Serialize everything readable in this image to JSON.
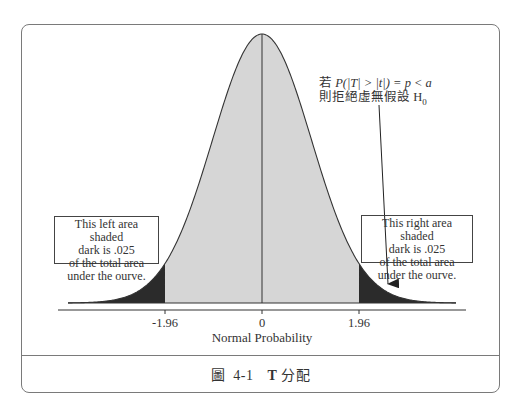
{
  "chart_data": {
    "type": "area",
    "title": "圖 4-1 T 分配",
    "xlabel": "Normal Probability",
    "ylabel": "",
    "x_ticks": [
      -1.96,
      0,
      1.96
    ],
    "x_tick_labels": [
      "-1.96",
      "0",
      "1.96"
    ],
    "distribution": "standard normal density curve",
    "shaded_regions": [
      {
        "name": "left tail",
        "from": "-inf",
        "to": -1.96,
        "area": 0.025,
        "shade": "dark"
      },
      {
        "name": "center",
        "from": -1.96,
        "to": 1.96,
        "area": 0.95,
        "shade": "light"
      },
      {
        "name": "right tail",
        "from": 1.96,
        "to": "inf",
        "area": 0.025,
        "shade": "dark"
      }
    ],
    "annotations": [
      "This left area shaded dark is .025 of the total area under the ourve.",
      "This right area shaded dark is .025 of the total area under the ourve.",
      "若 P(|T| > |t|) = p < a 則拒絕虛無假設 H0"
    ],
    "grid": false,
    "legend": null
  },
  "figure": {
    "caption_prefix": "圖",
    "caption_number": "4-1",
    "caption_bold": "T",
    "caption_text": "分配"
  },
  "annotation_top": {
    "line1_prefix": "若 ",
    "line1_formula": "P(|T| > |t|) = p < a",
    "line2_text": "則拒絕虛無假設 H",
    "line2_sub": "0"
  },
  "left_box": {
    "lines": [
      "This left area shaded",
      "dark is .025",
      "of the total area",
      "under the ourve."
    ]
  },
  "right_box": {
    "lines": [
      "This right area shaded",
      "dark is .025",
      "of the total area",
      "under the ourve."
    ]
  },
  "axis": {
    "ticks": [
      "-1.96",
      "0",
      "1.96"
    ],
    "label": "Normal Probability"
  },
  "colors": {
    "tail_fill": "#2b2b2b",
    "center_fill": "#d6d6d6",
    "frame": "#7a7a7a",
    "line": "#333333"
  }
}
